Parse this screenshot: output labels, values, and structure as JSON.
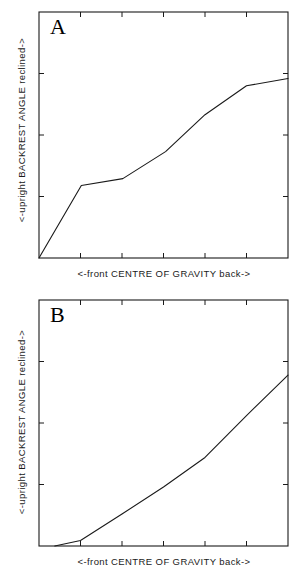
{
  "figure": {
    "background_color": "#ffffff",
    "line_color": "#1a1a1a",
    "axis_color": "#1a1a1a"
  },
  "panels": [
    {
      "id": "A",
      "letter": "A",
      "xlabel": "<-front  CENTRE OF GRAVITY  back->",
      "ylabel": "<-upright  BACKREST ANGLE  reclined->"
    },
    {
      "id": "B",
      "letter": "B",
      "xlabel": "<-front  CENTRE OF GRAVITY  back->",
      "ylabel": "<-upright  BACKREST ANGLE  reclined->"
    }
  ],
  "chart_data": [
    {
      "type": "line",
      "title": "A",
      "xlabel": "<-front  CENTRE OF GRAVITY  back->",
      "ylabel": "<-upright  BACKREST ANGLE  reclined->",
      "xlim": [
        0,
        6
      ],
      "ylim": [
        0,
        4
      ],
      "grid": false,
      "legend": "none",
      "axis_tick_labels": {
        "x": [],
        "y": []
      },
      "x_ticks": [
        1,
        2,
        3,
        4,
        5
      ],
      "y_ticks": [
        1,
        2,
        3
      ],
      "series": [
        {
          "name": "backrest angle vs centre of gravity (A)",
          "x": [
            0.0,
            1.02,
            2.02,
            3.05,
            4.0,
            5.0,
            6.0
          ],
          "y": [
            0.0,
            1.18,
            1.29,
            1.73,
            2.33,
            2.8,
            2.92
          ]
        }
      ]
    },
    {
      "type": "line",
      "title": "B",
      "xlabel": "<-front  CENTRE OF GRAVITY  back->",
      "ylabel": "<-upright  BACKREST ANGLE  reclined->",
      "xlim": [
        0,
        6
      ],
      "ylim": [
        0,
        4
      ],
      "grid": false,
      "legend": "none",
      "axis_tick_labels": {
        "x": [],
        "y": []
      },
      "x_ticks": [
        1,
        2,
        3,
        4,
        5
      ],
      "y_ticks": [
        1,
        2,
        3
      ],
      "series": [
        {
          "name": "backrest angle vs centre of gravity (B)",
          "x": [
            0.38,
            1.0,
            2.0,
            3.0,
            4.0,
            5.0,
            6.0
          ],
          "y": [
            0.0,
            0.09,
            0.52,
            0.96,
            1.44,
            2.12,
            2.78
          ]
        }
      ]
    }
  ]
}
